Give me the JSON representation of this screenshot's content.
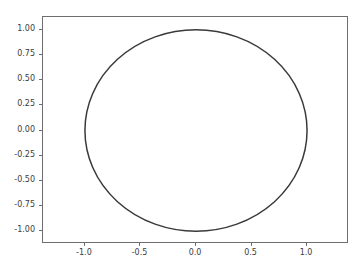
{
  "chart_data": {
    "type": "line",
    "title": "",
    "xlabel": "",
    "ylabel": "",
    "curve": {
      "name": "unit-circle",
      "shape": "circle",
      "center_x": 0,
      "center_y": 0,
      "radius": 1,
      "color": "#3a3a3a",
      "linewidth": 1.5
    },
    "xlim": [
      -1.3776,
      1.3776
    ],
    "ylim": [
      -1.1275,
      1.1275
    ],
    "grid": false,
    "legend": null,
    "xticks": [
      {
        "value": -1.0,
        "label": "-1.0"
      },
      {
        "value": -0.5,
        "label": "-0.5"
      },
      {
        "value": 0.0,
        "label": "0.0"
      },
      {
        "value": 0.5,
        "label": "0.5"
      },
      {
        "value": 1.0,
        "label": "1.0"
      }
    ],
    "yticks": [
      {
        "value": 1.0,
        "label": "1.00"
      },
      {
        "value": 0.75,
        "label": "0.75"
      },
      {
        "value": 0.5,
        "label": "0.50"
      },
      {
        "value": 0.25,
        "label": "0.25"
      },
      {
        "value": 0.0,
        "label": "0.00"
      },
      {
        "value": -0.25,
        "label": "-0.25"
      },
      {
        "value": -0.5,
        "label": "-0.50"
      },
      {
        "value": -0.75,
        "label": "-0.75"
      },
      {
        "value": -1.0,
        "label": "-1.00"
      }
    ],
    "extreme_points": {
      "top": [
        0.0,
        1.0
      ],
      "bottom": [
        0.0,
        -1.0
      ],
      "left": [
        -1.0,
        0.0
      ],
      "right": [
        1.0,
        0.0
      ]
    }
  },
  "style": {
    "figure_background": "#ffffff",
    "axes_background": "#ffffff",
    "spine_color": "#6e6e72",
    "tick_label_color": "#3c3c40",
    "line_color": "#3a3a3a"
  }
}
